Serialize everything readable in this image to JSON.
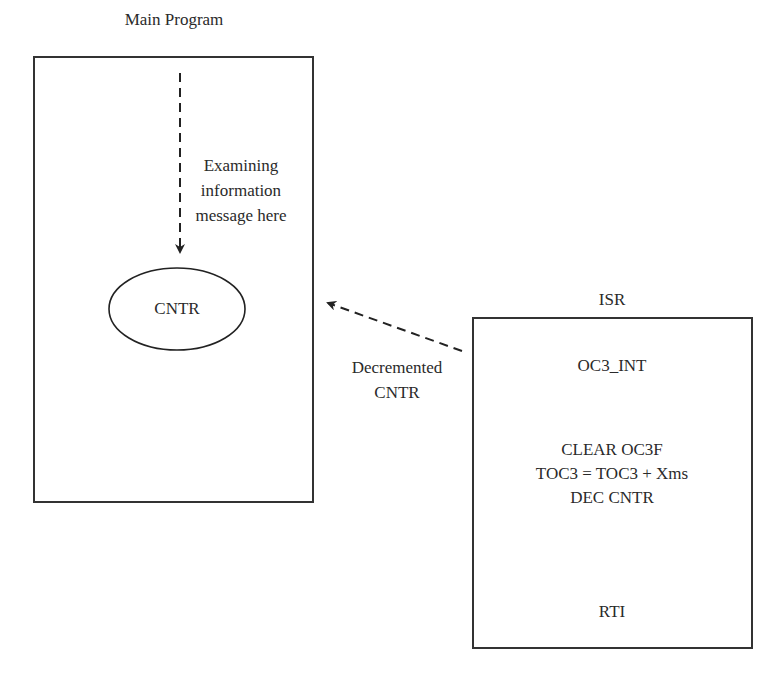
{
  "diagram": {
    "main_program": {
      "title": "Main Program",
      "annotation_lines": [
        "Examining",
        "information",
        "message here"
      ],
      "node": "CNTR"
    },
    "isr": {
      "title": "ISR",
      "entry": "OC3_INT",
      "body_lines": [
        "CLEAR OC3F",
        "TOC3 = TOC3 + Xms",
        "DEC CNTR"
      ],
      "exit": "RTI"
    },
    "connector": {
      "label_lines": [
        "Decremented",
        "CNTR"
      ],
      "from": "ISR",
      "to": "CNTR"
    },
    "colors": {
      "stroke": "#333333",
      "text": "#2a2a2a",
      "background": "#ffffff"
    }
  }
}
